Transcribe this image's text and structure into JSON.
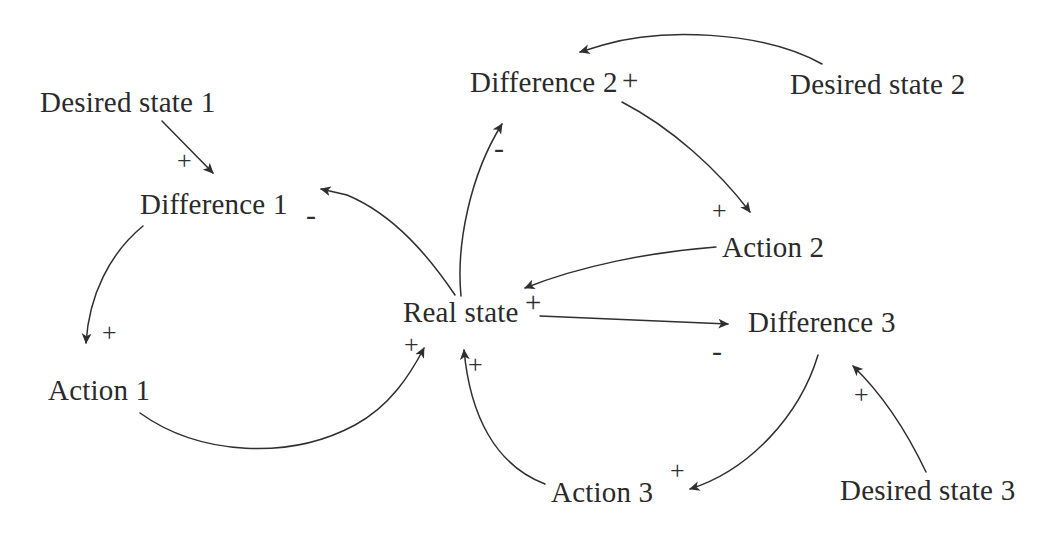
{
  "diagram": {
    "background_color": "#ffffff",
    "stroke_color": "#2f2f2f",
    "width": 1062,
    "height": 548,
    "nodes": [
      {
        "id": "desired-state-1",
        "label": "Desired state 1",
        "x": 40,
        "y": 88
      },
      {
        "id": "difference-1",
        "label": "Difference 1",
        "x": 140,
        "y": 190
      },
      {
        "id": "action-1",
        "label": "Action 1",
        "x": 48,
        "y": 376
      },
      {
        "id": "difference-2",
        "label": "Difference 2",
        "x": 470,
        "y": 68
      },
      {
        "id": "desired-state-2",
        "label": "Desired state 2",
        "x": 790,
        "y": 70
      },
      {
        "id": "action-2",
        "label": "Action 2",
        "x": 722,
        "y": 233
      },
      {
        "id": "real-state",
        "label": "Real state",
        "x": 403,
        "y": 298
      },
      {
        "id": "difference-3",
        "label": "Difference 3",
        "x": 748,
        "y": 308
      },
      {
        "id": "desired-state-3",
        "label": "Desired state 3",
        "x": 840,
        "y": 476
      },
      {
        "id": "action-3",
        "label": "Action 3",
        "x": 551,
        "y": 478
      }
    ],
    "signs": [
      {
        "id": "sign-desired1-to-difference1",
        "symbol": "+",
        "x": 177,
        "y": 148,
        "polarity": "positive"
      },
      {
        "id": "sign-realstate-to-difference1",
        "symbol": "-",
        "x": 306,
        "y": 200,
        "polarity": "negative"
      },
      {
        "id": "sign-difference1-to-action1",
        "symbol": "+",
        "x": 102,
        "y": 320,
        "polarity": "positive"
      },
      {
        "id": "sign-realstate-to-difference2",
        "symbol": "-",
        "x": 494,
        "y": 139,
        "polarity": "negative"
      },
      {
        "id": "sign-desired2-to-difference2",
        "symbol": "+",
        "x": 622,
        "y": 66,
        "polarity": "positive"
      },
      {
        "id": "sign-difference2-to-action2",
        "symbol": "+",
        "x": 712,
        "y": 198,
        "polarity": "positive"
      },
      {
        "id": "sign-realstate-out",
        "symbol": "+",
        "x": 525,
        "y": 289,
        "polarity": "positive"
      },
      {
        "id": "sign-action1-to-realstate",
        "symbol": "+",
        "x": 404,
        "y": 332,
        "polarity": "positive"
      },
      {
        "id": "sign-action3-to-realstate",
        "symbol": "+",
        "x": 468,
        "y": 352,
        "polarity": "positive"
      },
      {
        "id": "sign-realstate-to-difference3",
        "symbol": "-",
        "x": 712,
        "y": 342,
        "polarity": "negative"
      },
      {
        "id": "sign-desired3-to-difference3",
        "symbol": "+",
        "x": 854,
        "y": 382,
        "polarity": "positive"
      },
      {
        "id": "sign-difference3-to-action3",
        "symbol": "+",
        "x": 670,
        "y": 458,
        "polarity": "positive"
      }
    ],
    "edges": [
      {
        "id": "edge-desired1-difference1",
        "from": "Desired state 1",
        "to": "Difference 1",
        "polarity": "+"
      },
      {
        "id": "edge-difference1-action1",
        "from": "Difference 1",
        "to": "Action 1",
        "polarity": "+"
      },
      {
        "id": "edge-action1-realstate",
        "from": "Action 1",
        "to": "Real state",
        "polarity": "+"
      },
      {
        "id": "edge-realstate-difference1",
        "from": "Real state",
        "to": "Difference 1",
        "polarity": "-"
      },
      {
        "id": "edge-realstate-difference2",
        "from": "Real state",
        "to": "Difference 2",
        "polarity": "-"
      },
      {
        "id": "edge-desired2-difference2",
        "from": "Desired state 2",
        "to": "Difference 2",
        "polarity": "+"
      },
      {
        "id": "edge-difference2-action2",
        "from": "Difference 2",
        "to": "Action 2",
        "polarity": "+"
      },
      {
        "id": "edge-action2-realstate",
        "from": "Action 2",
        "to": "Real state",
        "polarity": "+"
      },
      {
        "id": "edge-realstate-difference3",
        "from": "Real state",
        "to": "Difference 3",
        "polarity": "-"
      },
      {
        "id": "edge-desired3-difference3",
        "from": "Desired state 3",
        "to": "Difference 3",
        "polarity": "+"
      },
      {
        "id": "edge-difference3-action3",
        "from": "Difference 3",
        "to": "Action 3",
        "polarity": "+"
      },
      {
        "id": "edge-action3-realstate",
        "from": "Action 3",
        "to": "Real state",
        "polarity": "+"
      }
    ]
  }
}
